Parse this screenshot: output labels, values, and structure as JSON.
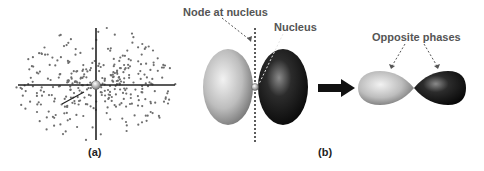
{
  "figure": {
    "panel_a": {
      "label": "(a)",
      "description": "Electron density dot plot of a p orbital with axes and nucleus"
    },
    "panel_b": {
      "label": "(b)",
      "annotations": {
        "node": "Node at nucleus",
        "nucleus": "Nucleus",
        "phases": "Opposite phases"
      }
    },
    "colors": {
      "dots": "#6e6e6e",
      "axis": "#222222",
      "light_lobe": "#c8c8c8",
      "dark_lobe": "#1a1a1a",
      "annotation_text": "#555555",
      "arrow": "#111111"
    }
  }
}
